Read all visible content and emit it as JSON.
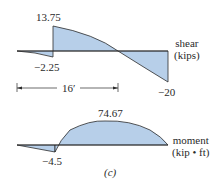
{
  "figure_label": "(c)",
  "shear": {
    "axis_label_line1": "shear",
    "axis_label_line2": "(kips)",
    "values": {
      "max": "13.75",
      "left_min": "−2.25",
      "right_min": "−20"
    },
    "dimension": "16′"
  },
  "moment": {
    "axis_label_line1": "moment",
    "axis_label_line2": "(kip • ft)",
    "values": {
      "max": "74.67",
      "min": "−4.5"
    }
  },
  "colors": {
    "fill": "#b7cfe9",
    "stroke": "#2b2b2b"
  }
}
